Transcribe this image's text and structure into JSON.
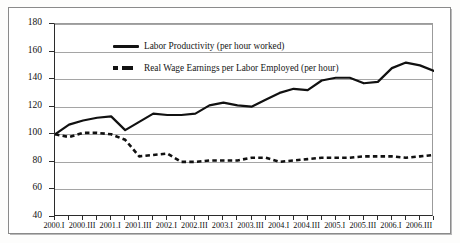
{
  "figure": {
    "title": "",
    "frame_color": "#8a8a8a"
  },
  "chart_data": {
    "type": "line",
    "title": "",
    "subtitle": "",
    "xlabel": "",
    "ylabel": "",
    "ylim": [
      40,
      180
    ],
    "ytick_values": [
      40,
      60,
      80,
      100,
      120,
      140,
      160,
      180
    ],
    "ytick_labels": [
      "40",
      "60",
      "80",
      "100",
      "120",
      "140",
      "160",
      "180"
    ],
    "grid": true,
    "legend_position": "upper-left-inside",
    "index_base": 100,
    "categories": [
      "2000.I",
      "2000.II",
      "2000.III",
      "2000.IV",
      "2001.I",
      "2001.II",
      "2001.III",
      "2001.IV",
      "2002.I",
      "2002.II",
      "2002.III",
      "2002.IV",
      "2003.I",
      "2003.II",
      "2003.III",
      "2003.IV",
      "2004.I",
      "2004.II",
      "2004.III",
      "2004.IV",
      "2005.I",
      "2005.II",
      "2005.III",
      "2005.IV",
      "2006.I",
      "2006.II",
      "2006.III",
      "2006.IV"
    ],
    "xtick_labels": [
      "2000.I",
      "2000.III",
      "2001.I",
      "2001.III",
      "2002.I",
      "2002.III",
      "2003.I",
      "2003.III",
      "2004.I",
      "2004.III",
      "2005.I",
      "2005.III",
      "2006.I",
      "2006.III"
    ],
    "xtick_indices": [
      0,
      2,
      4,
      6,
      8,
      10,
      12,
      14,
      16,
      18,
      20,
      22,
      24,
      26
    ],
    "series": [
      {
        "name": "Labor Productivity (per hour worked)",
        "style": "solid",
        "color": "#111111",
        "values": [
          100,
          107,
          110,
          112,
          113,
          103,
          109,
          115,
          114,
          114,
          115,
          121,
          123,
          121,
          120,
          125,
          130,
          133,
          132,
          139,
          141,
          141,
          137,
          138,
          148,
          152,
          150,
          146
        ]
      },
      {
        "name": "Real Wage Earnings per Labor Employed (per hour)",
        "style": "dashed",
        "color": "#111111",
        "values": [
          100,
          98,
          101,
          101,
          100,
          96,
          84,
          85,
          86,
          80,
          80,
          81,
          81,
          81,
          83,
          83,
          80,
          81,
          82,
          83,
          83,
          83,
          84,
          84,
          84,
          83,
          84,
          85
        ]
      }
    ],
    "series_extra": {
      "note": "Solid series continues upward to a peak of about 167 at 2006.II and ends near 159 at 2006.IV"
    }
  },
  "legend": {
    "items": [
      {
        "label": "Labor Productivity (per hour worked)",
        "marker": "solid-line"
      },
      {
        "label": "Real Wage Earnings per Labor Employed (per hour)",
        "marker": "dashed-line"
      }
    ]
  }
}
